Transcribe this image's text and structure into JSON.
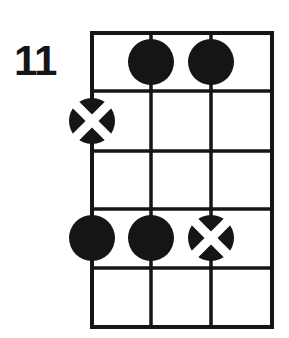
{
  "diagram": {
    "type": "guitar-chord-diagram",
    "position_label": "11",
    "strings_count": 4,
    "frets_count": 5,
    "colors": {
      "ink": "#151515",
      "background": "#ffffff",
      "marker_fill": "#151515",
      "marker_cross": "#ffffff"
    },
    "grid": {
      "left": 92,
      "right": 272,
      "top": 33,
      "bottom": 327,
      "string_x": [
        92,
        151,
        211,
        272
      ],
      "fret_y": [
        33,
        91,
        151,
        209,
        268,
        327
      ],
      "line_width": 3.5,
      "outer_line_width": 4
    },
    "markers": [
      {
        "id": "marker-1",
        "kind": "dot",
        "label": "filled-dot",
        "string": 2,
        "fret": 1,
        "cx": 151,
        "cy": 62,
        "r": 23
      },
      {
        "id": "marker-2",
        "kind": "dot",
        "label": "filled-dot",
        "string": 3,
        "fret": 1,
        "cx": 211,
        "cy": 62,
        "r": 23
      },
      {
        "id": "marker-3",
        "kind": "cross",
        "label": "crossed-dot",
        "string": 1,
        "fret": 2,
        "cx": 92,
        "cy": 121,
        "r": 23
      },
      {
        "id": "marker-4",
        "kind": "dot",
        "label": "filled-dot",
        "string": 1,
        "fret": 4,
        "cx": 92,
        "cy": 238,
        "r": 23
      },
      {
        "id": "marker-5",
        "kind": "dot",
        "label": "filled-dot",
        "string": 2,
        "fret": 4,
        "cx": 151,
        "cy": 238,
        "r": 23
      },
      {
        "id": "marker-6",
        "kind": "cross",
        "label": "crossed-dot",
        "string": 3,
        "fret": 4,
        "cx": 211,
        "cy": 238,
        "r": 23
      }
    ]
  }
}
